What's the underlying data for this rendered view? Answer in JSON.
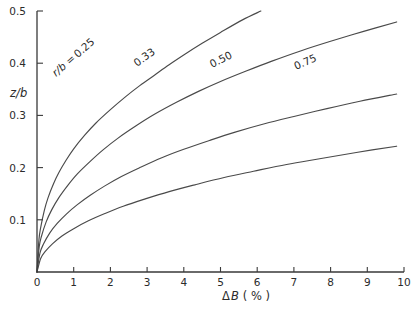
{
  "chart_data": {
    "type": "line",
    "title": "",
    "xlabel": "ΔB (%)",
    "xlabel_parts": {
      "delta": "Δ",
      "symbol": "B",
      "unit": "( % )"
    },
    "ylabel": "z/b",
    "ylabel_parts": {
      "numerator": "z",
      "slash": "/",
      "denominator": "b"
    },
    "xlim": [
      0,
      10
    ],
    "ylim": [
      0,
      0.5
    ],
    "xticks": [
      0,
      1,
      2,
      3,
      4,
      5,
      6,
      7,
      8,
      9,
      10
    ],
    "xticklabels": [
      "0",
      "1",
      "2",
      "3",
      "4",
      "5",
      "6",
      "7",
      "8",
      "9",
      "10"
    ],
    "yticks": [
      0.1,
      0.2,
      0.3,
      0.4,
      0.5
    ],
    "yticklabels": [
      "0.1",
      "0.2",
      "0.3",
      "0.4",
      "0.5"
    ],
    "grid": false,
    "legend_position": "inline-curve-labels",
    "line_color": "#4a4a4a",
    "axis_color": "#3a3a3a",
    "series": [
      {
        "name": "r/b = 0.25",
        "label": "r/b = 0.25",
        "label_prefix": "r/b =",
        "label_value": "0.25",
        "points": [
          [
            0.0,
            0.0
          ],
          [
            0.05,
            0.06
          ],
          [
            0.1,
            0.085
          ],
          [
            0.2,
            0.118
          ],
          [
            0.3,
            0.142
          ],
          [
            0.45,
            0.169
          ],
          [
            0.6,
            0.191
          ],
          [
            0.8,
            0.215
          ],
          [
            1.0,
            0.236
          ],
          [
            1.3,
            0.262
          ],
          [
            1.6,
            0.285
          ],
          [
            2.0,
            0.311
          ],
          [
            2.4,
            0.335
          ],
          [
            2.8,
            0.357
          ],
          [
            3.2,
            0.377
          ],
          [
            3.6,
            0.397
          ],
          [
            4.05,
            0.418
          ],
          [
            4.5,
            0.438
          ],
          [
            5.0,
            0.459
          ],
          [
            5.6,
            0.483
          ],
          [
            6.1,
            0.5
          ]
        ]
      },
      {
        "name": "0.33",
        "label": "0.33",
        "label_prefix": "",
        "label_value": "0.33",
        "points": [
          [
            0.0,
            0.0
          ],
          [
            0.06,
            0.048
          ],
          [
            0.12,
            0.068
          ],
          [
            0.25,
            0.096
          ],
          [
            0.4,
            0.119
          ],
          [
            0.6,
            0.143
          ],
          [
            0.85,
            0.167
          ],
          [
            1.1,
            0.188
          ],
          [
            1.45,
            0.212
          ],
          [
            1.8,
            0.234
          ],
          [
            2.2,
            0.256
          ],
          [
            2.7,
            0.28
          ],
          [
            3.2,
            0.302
          ],
          [
            3.8,
            0.325
          ],
          [
            4.4,
            0.346
          ],
          [
            5.0,
            0.365
          ],
          [
            5.7,
            0.385
          ],
          [
            6.4,
            0.404
          ],
          [
            7.2,
            0.424
          ],
          [
            8.0,
            0.442
          ],
          [
            8.9,
            0.461
          ],
          [
            9.8,
            0.479
          ]
        ]
      },
      {
        "name": "0.50",
        "label": "0.50",
        "label_prefix": "",
        "label_value": "0.50",
        "points": [
          [
            0.0,
            0.0
          ],
          [
            0.08,
            0.036
          ],
          [
            0.18,
            0.054
          ],
          [
            0.35,
            0.075
          ],
          [
            0.55,
            0.093
          ],
          [
            0.8,
            0.111
          ],
          [
            1.1,
            0.129
          ],
          [
            1.45,
            0.147
          ],
          [
            1.85,
            0.165
          ],
          [
            2.3,
            0.183
          ],
          [
            2.8,
            0.2
          ],
          [
            3.4,
            0.219
          ],
          [
            4.0,
            0.235
          ],
          [
            4.7,
            0.252
          ],
          [
            5.4,
            0.268
          ],
          [
            6.2,
            0.284
          ],
          [
            7.0,
            0.298
          ],
          [
            7.9,
            0.313
          ],
          [
            8.8,
            0.327
          ],
          [
            9.8,
            0.341
          ]
        ]
      },
      {
        "name": "0.75",
        "label": "0.75",
        "label_prefix": "",
        "label_value": "0.75",
        "points": [
          [
            0.0,
            0.0
          ],
          [
            0.1,
            0.026
          ],
          [
            0.22,
            0.039
          ],
          [
            0.42,
            0.054
          ],
          [
            0.68,
            0.069
          ],
          [
            1.0,
            0.083
          ],
          [
            1.4,
            0.098
          ],
          [
            1.85,
            0.112
          ],
          [
            2.35,
            0.126
          ],
          [
            2.95,
            0.14
          ],
          [
            3.6,
            0.154
          ],
          [
            4.3,
            0.167
          ],
          [
            5.1,
            0.181
          ],
          [
            5.9,
            0.193
          ],
          [
            6.8,
            0.206
          ],
          [
            7.7,
            0.217
          ],
          [
            8.7,
            0.229
          ],
          [
            9.8,
            0.241
          ]
        ]
      }
    ]
  }
}
